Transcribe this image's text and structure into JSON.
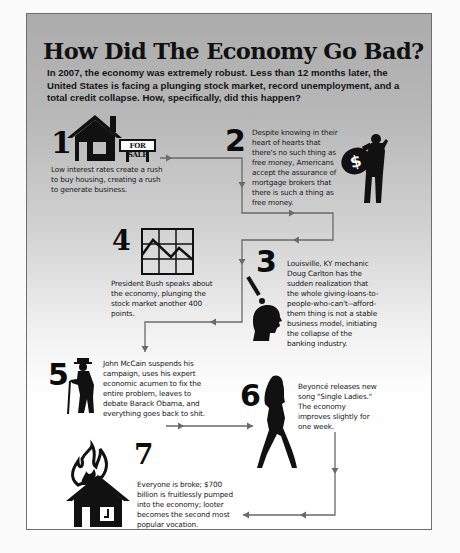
{
  "title": "How Did The Economy Go Bad?",
  "subtitle": "In 2007, the economy was extremely robust. Less than 12 months later, the United States is facing a plunging stock market, record unemployment, and a total credit collapse. How, specifically, did this happen?",
  "colors": {
    "panel_top": "#acacac",
    "panel_bottom": "#ffffff",
    "border": "#6e6e6e",
    "connector": "#6a6a6a",
    "ink": "#111111"
  },
  "steps": [
    {
      "number": "1",
      "icon": "house-for-sale-icon",
      "sign_label": "FOR SALE",
      "text": "Low interest rates create a rush to buy housing, creating a rush to generate business."
    },
    {
      "number": "2",
      "icon": "man-with-money-bag-icon",
      "text": "Despite knowing in their heart of hearts that there's no such thing as free money, Americans accept the assurance of mortgage brokers that there is such a thing as free money."
    },
    {
      "number": "3",
      "icon": "head-exclamation-icon",
      "text": "Louisville, KY mechanic Doug Carlton has the sudden realization that the whole giving-loans-to-people-who-can't--afford-them thing is not a stable business model, initiating the collapse of the banking industry."
    },
    {
      "number": "4",
      "icon": "stock-chart-down-icon",
      "text": "President Bush speaks about the economy, plunging the stock market another 400 points."
    },
    {
      "number": "5",
      "icon": "old-man-with-cane-icon",
      "text": "John McCain suspends his campaign, uses his expert economic acumen to fix the entire problem, leaves to debate Barack Obama, and everything goes back to shit."
    },
    {
      "number": "6",
      "icon": "woman-silhouette-icon",
      "text": "Beyoncé releases new song \"Single Ladies.\" The economy improves slightly for one week."
    },
    {
      "number": "7",
      "icon": "burning-house-icon",
      "text": "Everyone is broke; $700 billion is fruitlessly pumped into the economy; looter becomes the second most popular vocation."
    }
  ]
}
